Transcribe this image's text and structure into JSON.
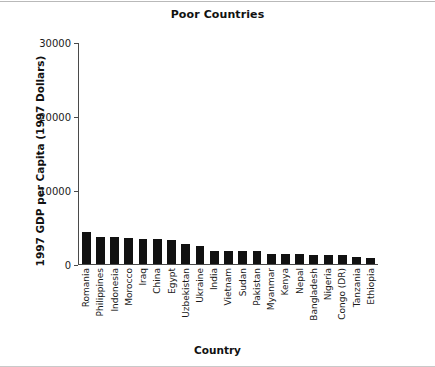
{
  "chart_data": {
    "type": "bar",
    "title": "Poor Countries",
    "xlabel": "Country",
    "ylabel": "1997 GDP per Capita (1997 Dollars)",
    "ylim": [
      0,
      30000
    ],
    "yticks": [
      0,
      10000,
      20000,
      30000
    ],
    "ytick_labels": [
      "0",
      "10000",
      "20000",
      "30000"
    ],
    "grid": false,
    "legend": null,
    "bar_color": "#111111",
    "categories": [
      "Romania",
      "Philippines",
      "Indonesia",
      "Morocco",
      "Iraq",
      "China",
      "Egypt",
      "Uzbekistan",
      "Ukraine",
      "India",
      "Vietnam",
      "Sudan",
      "Pakistan",
      "Myanmar",
      "Kenya",
      "Nepal",
      "Bangladesh",
      "Nigeria",
      "Congo (DR)",
      "Tanzania",
      "Ethiopia"
    ],
    "values": [
      4300,
      3600,
      3600,
      3500,
      3400,
      3350,
      3300,
      2700,
      2400,
      1800,
      1800,
      1750,
      1750,
      1400,
      1400,
      1350,
      1250,
      1200,
      1200,
      900,
      850
    ]
  }
}
